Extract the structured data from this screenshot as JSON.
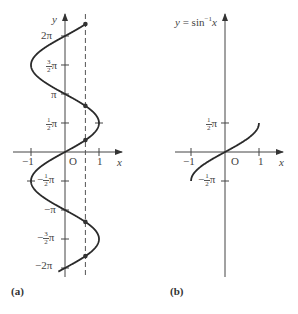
{
  "chart_data": [
    {
      "panel": "(a)",
      "type": "line",
      "title": "",
      "curve": "x = sin y",
      "xlabel": "x",
      "ylabel": "y",
      "origin_label": "O",
      "x_ticks": [
        {
          "value": -1,
          "label": "−1"
        },
        {
          "value": 1,
          "label": "1"
        }
      ],
      "y_ticks": [
        {
          "value": 6.2832,
          "label": "2π"
        },
        {
          "value": 4.7124,
          "label": "3/2π"
        },
        {
          "value": 3.1416,
          "label": "π"
        },
        {
          "value": 1.5708,
          "label": "1/2π"
        },
        {
          "value": -1.5708,
          "label": "−1/2π"
        },
        {
          "value": -3.1416,
          "label": "−π"
        },
        {
          "value": -4.7124,
          "label": "−3/2π"
        },
        {
          "value": -6.2832,
          "label": "−2π"
        }
      ],
      "xlim": [
        -1.1,
        1.6
      ],
      "ylim": [
        -6.6,
        7.3
      ],
      "y_range_curve": [
        -6.48,
        6.93
      ],
      "dashed_vertical_line_x": 0.6,
      "marked_points": [
        {
          "x": 0.6,
          "y": 0.6435
        },
        {
          "x": 0.6,
          "y": 2.4981
        },
        {
          "x": 0.6,
          "y": 6.9267
        },
        {
          "x": 0.6,
          "y": -3.7851
        },
        {
          "x": 0.6,
          "y": -5.6397
        }
      ]
    },
    {
      "panel": "(b)",
      "type": "line",
      "title": "y = sin⁻¹x",
      "curve": "y = arcsin x",
      "xlabel": "x",
      "ylabel": "",
      "origin_label": "O",
      "x_ticks": [
        {
          "value": -1,
          "label": "−1"
        },
        {
          "value": 1,
          "label": "1"
        }
      ],
      "y_ticks": [
        {
          "value": 1.5708,
          "label": "1/2π"
        },
        {
          "value": -1.5708,
          "label": "−1/2π"
        }
      ],
      "xlim": [
        -1.1,
        1.6
      ],
      "ylim": [
        -6.6,
        7.3
      ],
      "x_range_curve": [
        -1,
        1
      ]
    }
  ],
  "labels": {
    "a": {
      "y_axis": "y",
      "x_axis": "x",
      "origin": "O",
      "x_neg1": "−1",
      "x_pos1": "1",
      "two_pi": "2π",
      "pi": "π",
      "neg_pi": "−π",
      "neg_two_pi": "−2π",
      "frac_num": "1",
      "frac_three": "3",
      "frac_den": "2",
      "pi_sym": "π",
      "minus": "−",
      "panel": "(a)"
    },
    "b": {
      "title": "y = sin⁻¹x",
      "x_axis": "x",
      "origin": "O",
      "x_neg1": "−1",
      "x_pos1": "1",
      "frac_num": "1",
      "frac_den": "2",
      "pi_sym": "π",
      "minus": "−",
      "panel": "(b)"
    }
  }
}
